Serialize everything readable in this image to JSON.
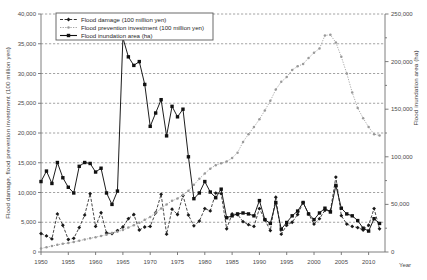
{
  "chart_data": {
    "type": "line",
    "title": "",
    "xlabel": "Year",
    "ylabel": "Flood damage, flood prevention investment (100 million yen)",
    "y2label": "Flood inundation area (ha)",
    "xlim": [
      1950,
      2013
    ],
    "ylim": [
      0,
      40000
    ],
    "y2lim": [
      0,
      250000
    ],
    "grid": true,
    "legend_position": "top-left-inside",
    "xticks": [
      1950,
      1955,
      1960,
      1965,
      1970,
      1975,
      1980,
      1985,
      1990,
      1995,
      2000,
      2005,
      2010
    ],
    "xtick_labels": [
      "1950",
      "1955",
      "1960",
      "1965",
      "1970",
      "1975",
      "1980",
      "1985",
      "1990",
      "1995",
      "2000",
      "2005",
      "2010"
    ],
    "yticks": [
      0,
      5000,
      10000,
      15000,
      20000,
      25000,
      30000,
      35000,
      40000
    ],
    "ytick_labels": [
      "0",
      "5,000",
      "10,000",
      "15,000",
      "20,000",
      "25,000",
      "30,000",
      "35,000",
      "40,000"
    ],
    "y2ticks": [
      0,
      50000,
      100000,
      150000,
      200000,
      250000
    ],
    "y2tick_labels": [
      "0",
      "50,000",
      "100,000",
      "150,000",
      "200,000",
      "250,000"
    ],
    "y2_minor_step": 25000,
    "series": [
      {
        "name": "Flood damage (100 million yen)",
        "axis": "left",
        "color": "#1a1a1a",
        "style": "dashed",
        "marker": "diamond",
        "x": [
          1950,
          1951,
          1952,
          1953,
          1954,
          1955,
          1956,
          1957,
          1958,
          1959,
          1960,
          1961,
          1962,
          1963,
          1964,
          1965,
          1966,
          1967,
          1968,
          1969,
          1970,
          1971,
          1972,
          1973,
          1974,
          1975,
          1976,
          1977,
          1978,
          1979,
          1980,
          1981,
          1982,
          1983,
          1984,
          1985,
          1986,
          1987,
          1988,
          1989,
          1990,
          1991,
          1992,
          1993,
          1994,
          1995,
          1996,
          1997,
          1998,
          1999,
          2000,
          2001,
          2002,
          2003,
          2004,
          2005,
          2006,
          2007,
          2008,
          2009,
          2010,
          2011,
          2012
        ],
        "values": [
          3100,
          2700,
          2200,
          6400,
          4500,
          2100,
          2300,
          4100,
          6200,
          9800,
          4300,
          6600,
          3200,
          3100,
          3600,
          4200,
          5600,
          6300,
          3700,
          4200,
          4300,
          6600,
          9700,
          3000,
          7200,
          6300,
          9500,
          6200,
          4400,
          5200,
          7300,
          6900,
          9900,
          9800,
          3900,
          6400,
          6300,
          5100,
          4600,
          4300,
          7300,
          5400,
          3600,
          9200,
          3000,
          4500,
          5000,
          6300,
          8300,
          6400,
          4700,
          5600,
          7000,
          6900,
          12600,
          6100,
          4700,
          4300,
          4100,
          3700,
          4500,
          7300,
          3900
        ]
      },
      {
        "name": "Flood prevention investment (100 million yen)",
        "axis": "left",
        "color": "#9a9a9a",
        "style": "dotted",
        "marker": "small-circle",
        "x": [
          1950,
          1951,
          1952,
          1953,
          1954,
          1955,
          1956,
          1957,
          1958,
          1959,
          1960,
          1961,
          1962,
          1963,
          1964,
          1965,
          1966,
          1967,
          1968,
          1969,
          1970,
          1971,
          1972,
          1973,
          1974,
          1975,
          1976,
          1977,
          1978,
          1979,
          1980,
          1981,
          1982,
          1983,
          1984,
          1985,
          1986,
          1987,
          1988,
          1989,
          1990,
          1991,
          1992,
          1993,
          1994,
          1995,
          1996,
          1997,
          1998,
          1999,
          2000,
          2001,
          2002,
          2003,
          2004,
          2005,
          2006,
          2007,
          2008,
          2009,
          2010,
          2011,
          2012
        ],
        "values": [
          600,
          800,
          1000,
          1200,
          1400,
          1500,
          1700,
          1900,
          2100,
          2300,
          2500,
          2700,
          2900,
          3200,
          3400,
          3700,
          4100,
          4500,
          4900,
          5400,
          5900,
          6600,
          7300,
          8000,
          8600,
          9000,
          9600,
          10300,
          11300,
          12300,
          13200,
          14000,
          14600,
          14900,
          15200,
          15800,
          16700,
          18500,
          19800,
          21000,
          22300,
          23800,
          25400,
          27300,
          28600,
          29400,
          30600,
          31200,
          31600,
          32600,
          33500,
          34200,
          36400,
          36500,
          35200,
          32800,
          30000,
          26800,
          24200,
          22500,
          21000,
          19800,
          19600
        ]
      },
      {
        "name": "Flood inundation area (ha)",
        "axis": "right",
        "color": "#111111",
        "style": "solid",
        "marker": "square",
        "x": [
          1950,
          1951,
          1952,
          1953,
          1954,
          1955,
          1956,
          1957,
          1958,
          1959,
          1960,
          1961,
          1962,
          1963,
          1964,
          1965,
          1966,
          1967,
          1968,
          1969,
          1970,
          1971,
          1972,
          1973,
          1974,
          1975,
          1976,
          1977,
          1978,
          1979,
          1980,
          1981,
          1982,
          1983,
          1984,
          1985,
          1986,
          1987,
          1988,
          1989,
          1990,
          1991,
          1992,
          1993,
          1994,
          1995,
          1996,
          1997,
          1998,
          1999,
          2000,
          2001,
          2002,
          2003,
          2004,
          2005,
          2006,
          2007,
          2008,
          2009,
          2010,
          2011,
          2012
        ],
        "values": [
          74000,
          85000,
          72000,
          94000,
          78000,
          68000,
          62000,
          90000,
          94000,
          93000,
          84000,
          88000,
          62000,
          50000,
          64000,
          225000,
          205000,
          196000,
          200000,
          176000,
          132000,
          146000,
          160000,
          122000,
          153000,
          142000,
          150000,
          100000,
          56000,
          62000,
          74000,
          63000,
          57000,
          66000,
          36000,
          38000,
          40000,
          41000,
          40000,
          38000,
          54000,
          34000,
          30000,
          52000,
          24000,
          31000,
          38000,
          43000,
          52000,
          40000,
          34000,
          41000,
          46000,
          42000,
          70000,
          46000,
          40000,
          38000,
          33000,
          25000,
          22000,
          35000,
          30000
        ]
      }
    ]
  },
  "axes": {
    "left_title": "Flood damage, flood prevention investment (100 million yen)",
    "right_title": "Flood inundation area (ha)",
    "x_name": "Year"
  },
  "legend": {
    "items": [
      {
        "label": "Flood damage (100 million yen)"
      },
      {
        "label": "Flood prevention investment (100 million yen)"
      },
      {
        "label": "Flood inundation area (ha)"
      }
    ]
  }
}
